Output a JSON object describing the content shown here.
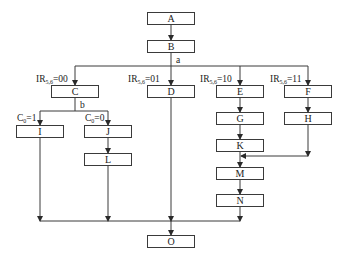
{
  "diagram": {
    "type": "flowchart",
    "nodes": [
      {
        "id": "A",
        "label": "A"
      },
      {
        "id": "B",
        "label": "B"
      },
      {
        "id": "C",
        "label": "C"
      },
      {
        "id": "D",
        "label": "D"
      },
      {
        "id": "E",
        "label": "E"
      },
      {
        "id": "F",
        "label": "F"
      },
      {
        "id": "G",
        "label": "G"
      },
      {
        "id": "H",
        "label": "H"
      },
      {
        "id": "I",
        "label": "I"
      },
      {
        "id": "J",
        "label": "J"
      },
      {
        "id": "K",
        "label": "K"
      },
      {
        "id": "L",
        "label": "L"
      },
      {
        "id": "M",
        "label": "M"
      },
      {
        "id": "N",
        "label": "N"
      },
      {
        "id": "O",
        "label": "O"
      }
    ],
    "point_labels": {
      "a": "a",
      "b": "b"
    },
    "branch_labels": {
      "ir00": {
        "base": "IR",
        "sub": "5,6",
        "value": "=00"
      },
      "ir01": {
        "base": "IR",
        "sub": "5,6",
        "value": "=01"
      },
      "ir10": {
        "base": "IR",
        "sub": "5,6",
        "value": "=10"
      },
      "ir11": {
        "base": "IR",
        "sub": "5,6",
        "value": "=11"
      },
      "c1": {
        "base": "C",
        "sub": "0",
        "value": "=1"
      },
      "c0": {
        "base": "C",
        "sub": "0",
        "value": "=0"
      }
    },
    "edges": [
      [
        "A",
        "B"
      ],
      [
        "B",
        "C"
      ],
      [
        "B",
        "D"
      ],
      [
        "B",
        "E"
      ],
      [
        "B",
        "F"
      ],
      [
        "C",
        "I"
      ],
      [
        "C",
        "J"
      ],
      [
        "J",
        "L"
      ],
      [
        "E",
        "G"
      ],
      [
        "G",
        "K"
      ],
      [
        "F",
        "H"
      ],
      [
        "K",
        "M"
      ],
      [
        "H",
        "M"
      ],
      [
        "M",
        "N"
      ],
      [
        "I",
        "O"
      ],
      [
        "L",
        "O"
      ],
      [
        "D",
        "O"
      ],
      [
        "N",
        "O"
      ]
    ],
    "colors": {
      "line": "#3a3a3a",
      "box_border": "#3a3a3a",
      "text": "#222222"
    }
  }
}
